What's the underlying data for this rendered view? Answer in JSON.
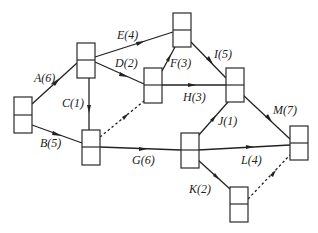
{
  "diagram": {
    "type": "activity-on-arrow network (double-code network diagram)",
    "nodes": [
      {
        "id": "1",
        "x": 14,
        "y": 97,
        "w": 18,
        "h": 36
      },
      {
        "id": "2",
        "x": 77,
        "y": 43,
        "w": 18,
        "h": 35
      },
      {
        "id": "3",
        "x": 82,
        "y": 130,
        "w": 18,
        "h": 35
      },
      {
        "id": "4",
        "x": 144,
        "y": 68,
        "w": 18,
        "h": 35
      },
      {
        "id": "5",
        "x": 173,
        "y": 13,
        "w": 18,
        "h": 34
      },
      {
        "id": "6",
        "x": 226,
        "y": 68,
        "w": 18,
        "h": 34
      },
      {
        "id": "7",
        "x": 181,
        "y": 133,
        "w": 18,
        "h": 35
      },
      {
        "id": "8",
        "x": 290,
        "y": 126,
        "w": 18,
        "h": 34
      },
      {
        "id": "9",
        "x": 230,
        "y": 187,
        "w": 18,
        "h": 35
      }
    ],
    "edges": [
      {
        "id": "A",
        "label": "A(6)",
        "from": "1",
        "to": "2",
        "dashed": false
      },
      {
        "id": "B",
        "label": "B(5)",
        "from": "1",
        "to": "3",
        "dashed": false
      },
      {
        "id": "C",
        "label": "C(1)",
        "from": "2",
        "to": "3",
        "dashed": false
      },
      {
        "id": "D",
        "label": "D(2)",
        "from": "2",
        "to": "4",
        "dashed": false
      },
      {
        "id": "E",
        "label": "E(4)",
        "from": "2",
        "to": "5",
        "dashed": false
      },
      {
        "id": "F",
        "label": "F(3)",
        "from": "4",
        "to": "5",
        "dashed": false
      },
      {
        "id": "H",
        "label": "H(3)",
        "from": "4",
        "to": "6",
        "dashed": false
      },
      {
        "id": "I",
        "label": "I(5)",
        "from": "5",
        "to": "6",
        "dashed": false
      },
      {
        "id": "G",
        "label": "G(6)",
        "from": "3",
        "to": "7",
        "dashed": false
      },
      {
        "id": "J",
        "label": "J(1)",
        "from": "7",
        "to": "6",
        "dashed": false
      },
      {
        "id": "M",
        "label": "M(7)",
        "from": "6",
        "to": "8",
        "dashed": false
      },
      {
        "id": "L",
        "label": "L(4)",
        "from": "7",
        "to": "8",
        "dashed": false
      },
      {
        "id": "K",
        "label": "K(2)",
        "from": "7",
        "to": "9",
        "dashed": false
      },
      {
        "id": "dummy1",
        "label": "",
        "from": "3",
        "to": "4",
        "dashed": true
      },
      {
        "id": "dummy2",
        "label": "",
        "from": "9",
        "to": "8",
        "dashed": true
      }
    ]
  },
  "labels": {
    "A": "A(6)",
    "B": "B(5)",
    "C": "C(1)",
    "D": "D(2)",
    "E": "E(4)",
    "F": "F(3)",
    "G": "G(6)",
    "H": "H(3)",
    "I": "I(5)",
    "J": "J(1)",
    "K": "K(2)",
    "L": "L(4)",
    "M": "M(7)"
  },
  "colors": {
    "line": "#222222",
    "background": "#ffffff"
  }
}
